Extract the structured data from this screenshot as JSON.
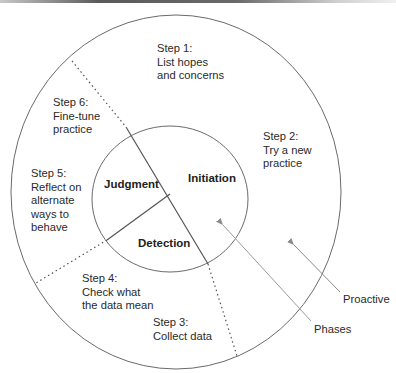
{
  "diagram": {
    "type": "concentric-cycle",
    "colors": {
      "stroke": "#666666",
      "text": "#2a2a2a",
      "arrow": "#8a8a8a"
    },
    "inner_phases": [
      {
        "id": "initiation",
        "label": "Initiation"
      },
      {
        "id": "judgment",
        "label": "Judgment"
      },
      {
        "id": "detection",
        "label": "Detection"
      }
    ],
    "outer_steps": [
      {
        "id": "step1",
        "lines": [
          "Step 1:",
          "List hopes",
          "and concerns"
        ]
      },
      {
        "id": "step2",
        "lines": [
          "Step 2:",
          "Try a new",
          "practice"
        ]
      },
      {
        "id": "step3",
        "lines": [
          "Step 3:",
          "Collect data"
        ]
      },
      {
        "id": "step4",
        "lines": [
          "Step 4:",
          "Check what",
          "the data mean"
        ]
      },
      {
        "id": "step5",
        "lines": [
          "Step 5:",
          "Reflect on",
          "alternate",
          "ways to",
          "behave"
        ]
      },
      {
        "id": "step6",
        "lines": [
          "Step 6:",
          "Fine-tune",
          "practice"
        ]
      }
    ],
    "callouts": [
      {
        "id": "phases",
        "label": "Phases",
        "points_to": "inner circle"
      },
      {
        "id": "proactive",
        "label": "Proactive",
        "points_to": "outer ring"
      }
    ]
  }
}
